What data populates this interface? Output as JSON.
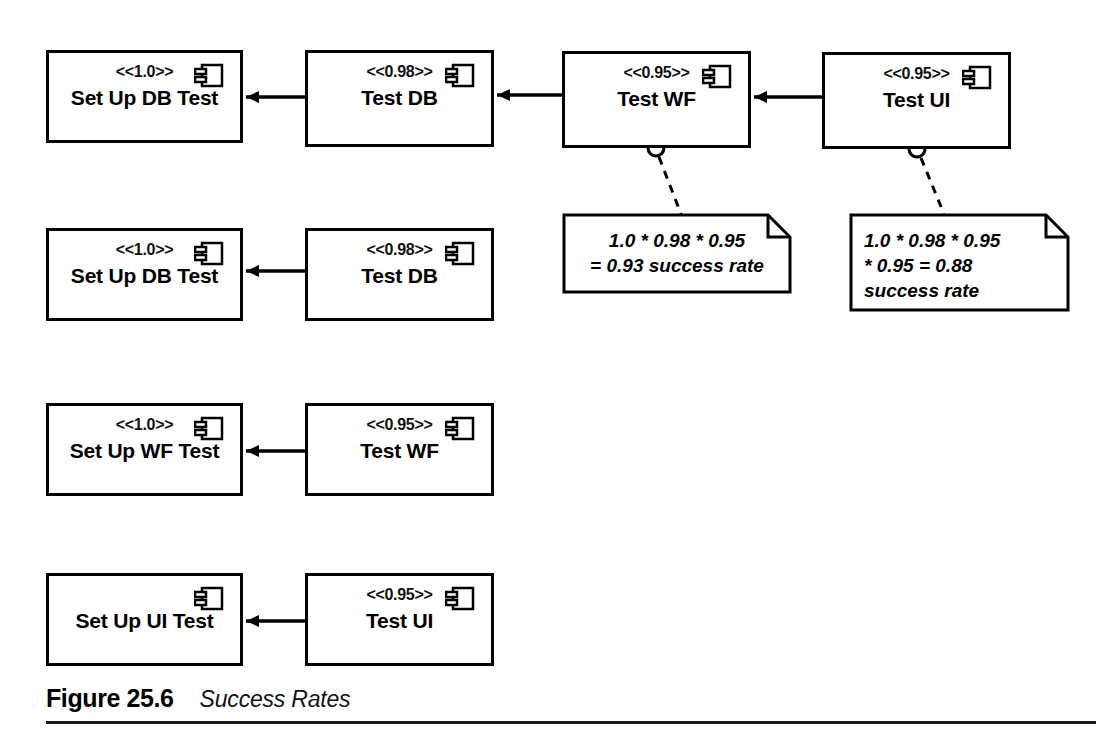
{
  "figure": {
    "label": "Figure 25.6",
    "title": "Success Rates"
  },
  "diagram": {
    "type": "uml-component-diagram",
    "icon_name": "uml-component-icon",
    "dependency_style": "solid-line-with-filled-arrowhead",
    "note_link_style": "dashed-line-with-anchor-circle",
    "components": [
      {
        "id": "r1-setup-db-test",
        "name": "Set Up DB Test",
        "stereotype": "<<1.0>>",
        "row": 1,
        "x": 46,
        "y": 50,
        "w": 197,
        "h": 93
      },
      {
        "id": "r1-test-db",
        "name": "Test DB",
        "stereotype": "<<0.98>>",
        "row": 1,
        "x": 305,
        "y": 50,
        "w": 189,
        "h": 97
      },
      {
        "id": "r1-test-wf",
        "name": "Test WF",
        "stereotype": "<<0.95>>",
        "row": 1,
        "x": 562,
        "y": 51,
        "w": 189,
        "h": 97
      },
      {
        "id": "r1-test-ui",
        "name": "Test UI",
        "stereotype": "<<0.95>>",
        "row": 1,
        "x": 822,
        "y": 52,
        "w": 189,
        "h": 97
      },
      {
        "id": "r2-setup-db-test",
        "name": "Set Up DB Test",
        "stereotype": "<<1.0>>",
        "row": 2,
        "x": 46,
        "y": 228,
        "w": 197,
        "h": 93
      },
      {
        "id": "r2-test-db",
        "name": "Test DB",
        "stereotype": "<<0.98>>",
        "row": 2,
        "x": 305,
        "y": 228,
        "w": 189,
        "h": 93
      },
      {
        "id": "r3-setup-wf-test",
        "name": "Set Up WF Test",
        "stereotype": "<<1.0>>",
        "row": 3,
        "x": 46,
        "y": 403,
        "w": 197,
        "h": 93
      },
      {
        "id": "r3-test-wf",
        "name": "Test WF",
        "stereotype": "<<0.95>>",
        "row": 3,
        "x": 305,
        "y": 403,
        "w": 189,
        "h": 93
      },
      {
        "id": "r4-setup-ui-test",
        "name": "Set Up UI Test",
        "stereotype": "",
        "row": 4,
        "x": 46,
        "y": 573,
        "w": 197,
        "h": 93
      },
      {
        "id": "r4-test-ui",
        "name": "Test UI",
        "stereotype": "<<0.95>>",
        "row": 4,
        "x": 305,
        "y": 573,
        "w": 189,
        "h": 93
      }
    ],
    "dependencies": [
      {
        "from": "r1-test-db",
        "to": "r1-setup-db-test"
      },
      {
        "from": "r1-test-wf",
        "to": "r1-test-db"
      },
      {
        "from": "r1-test-ui",
        "to": "r1-test-wf"
      },
      {
        "from": "r2-test-db",
        "to": "r2-setup-db-test"
      },
      {
        "from": "r3-test-wf",
        "to": "r3-setup-wf-test"
      },
      {
        "from": "r4-test-ui",
        "to": "r4-setup-ui-test"
      }
    ],
    "notes": [
      {
        "id": "note-wf",
        "attached_to": "r1-test-wf",
        "text": "1.0 * 0.98 * 0.95\n= 0.93 success rate",
        "align": "centered",
        "x": 564,
        "y": 215,
        "w": 226,
        "h": 77
      },
      {
        "id": "note-ui",
        "attached_to": "r1-test-ui",
        "text": "1.0 * 0.98 * 0.95\n* 0.95 = 0.88\nsuccess rate",
        "align": "left",
        "x": 851,
        "y": 215,
        "w": 217,
        "h": 95
      }
    ]
  },
  "colors": {
    "stroke": "#000000",
    "background": "#ffffff",
    "rule": "#1a1a1a"
  }
}
